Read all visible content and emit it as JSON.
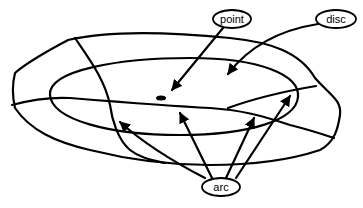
{
  "diagram": {
    "labels": {
      "point": "point",
      "disc": "disc",
      "arc": "arc"
    },
    "stroke_color": "#000000",
    "background_color": "#ffffff"
  }
}
